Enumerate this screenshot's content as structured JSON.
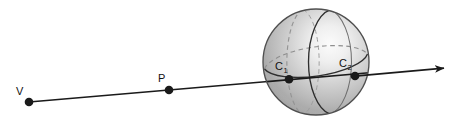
{
  "figure": {
    "background_color": "#ffffff",
    "width": 466,
    "height": 123
  },
  "labels": {
    "viewpoint": "V",
    "point_on_ray": "P",
    "near_intersection_base": "C",
    "near_intersection_sub": "1",
    "far_intersection_base": "C",
    "far_intersection_sub": "2"
  },
  "points": [
    {
      "name": "V",
      "label": "V",
      "x": 29,
      "y": 102,
      "radius": 4.2,
      "color": "#1a1a1a"
    },
    {
      "name": "P",
      "label": "P",
      "x": 169,
      "y": 90,
      "radius": 4.2,
      "color": "#1a1a1a"
    },
    {
      "name": "C1",
      "label": "C1",
      "x": 289,
      "y": 79,
      "radius": 4.2,
      "color": "#1a1a1a"
    },
    {
      "name": "C2",
      "label": "C2",
      "x": 355,
      "y": 76,
      "radius": 4.2,
      "color": "#1a1a1a"
    }
  ],
  "ray": {
    "start_x": 29,
    "start_y": 102,
    "end_x": 448,
    "end_y": 66,
    "color": "#1a1a1a",
    "width": 1.6,
    "arrowhead": "triangle"
  },
  "sphere": {
    "center_x": 316,
    "center_y": 62,
    "radius": 53,
    "fill_light": "#f2f2f2",
    "fill_mid": "#c2c2c2",
    "fill_dark": "#8e8e8e",
    "outline_color": "#4d4d4d",
    "highlight_x": 331,
    "highlight_y": 48,
    "meridian_solid_color": "#333333",
    "meridian_dashed_color": "#8a8a8a",
    "equator_front_color": "#333333",
    "equator_back_color": "#9a9a9a"
  },
  "colors": {
    "ink": "#1a1a1a",
    "sphere_outline": "#4d4d4d",
    "dashed_line": "#8a8a8a"
  }
}
